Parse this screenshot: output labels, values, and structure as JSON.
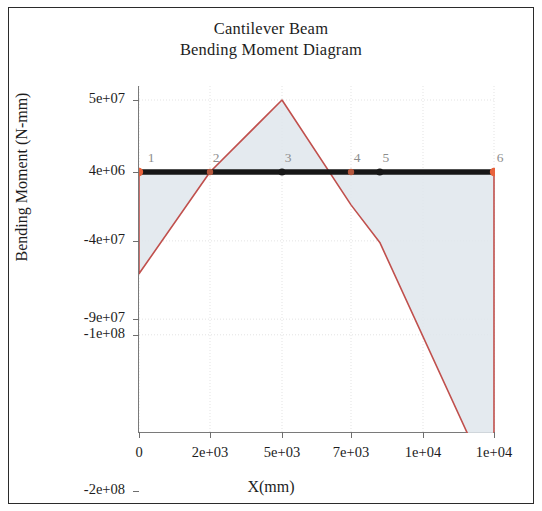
{
  "chart_data": {
    "type": "line",
    "title": "Cantilever Beam",
    "subtitle": "Bending Moment Diagram",
    "xlabel": "X(mm)",
    "ylabel": "Bending Moment (N-mm)",
    "xlim": [
      0,
      10000
    ],
    "ylim": [
      -200000000,
      50000000
    ],
    "grid": true,
    "legend": null,
    "xticks": [
      0,
      2000,
      5000,
      7000,
      9500,
      10000
    ],
    "xticklabels": [
      "0",
      "2e+03",
      "5e+03",
      "7e+03",
      "1e+04",
      "1e+04"
    ],
    "yticks": [
      50000000,
      4000000,
      -40000000,
      -90000000,
      -100000000,
      -200000000
    ],
    "yticklabels": [
      "5e+07",
      "4e+06",
      "-4e+07",
      "-9e+07",
      "-1e+08",
      "-2e+08"
    ],
    "series": [
      {
        "name": "bending-moment",
        "color": "#c0504d",
        "fill_color": "#dfe6ec",
        "x": [
          0,
          0,
          2000,
          5000,
          7000,
          8000,
          10000,
          10000
        ],
        "y": [
          4000000,
          -61000000,
          4000000,
          50000000,
          -17000000,
          -41000000,
          -200000000,
          4000000
        ]
      }
    ],
    "beam": {
      "color": "#171717",
      "y": 4000000,
      "x_start": 0,
      "x_end": 10000
    },
    "nodes": [
      {
        "label": "1",
        "x": 0,
        "marker": "support",
        "color": "#e8623c"
      },
      {
        "label": "2",
        "x": 2000,
        "marker": "hinge",
        "color": "#b4563c"
      },
      {
        "label": "3",
        "x": 5000,
        "marker": "point",
        "color": "#171717"
      },
      {
        "label": "4",
        "x": 7000,
        "marker": "hinge",
        "color": "#b4563c"
      },
      {
        "label": "5",
        "x": 8000,
        "marker": "point",
        "color": "#171717"
      },
      {
        "label": "6",
        "x": 10000,
        "marker": "support",
        "color": "#e8623c"
      }
    ]
  },
  "figure": {
    "background": "#ffffff",
    "border_color": "#2b2b2b",
    "axis_color": "#7a7a7a",
    "grid_color": "#e3e3e3",
    "text_color": "#1d1d1d",
    "node_label_color": "#8d8d8d"
  }
}
